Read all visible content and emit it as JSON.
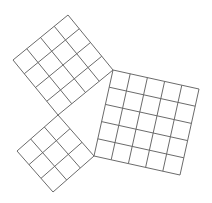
{
  "diagram": {
    "title": "",
    "stroke_color": "#6b6b6b",
    "background": "#ffffff",
    "squares": [
      {
        "name": "square-top",
        "grid": 4,
        "corners": [
          [
            58,
            115
          ],
          [
            113,
            70
          ],
          [
            68,
            15
          ],
          [
            13,
            60
          ]
        ]
      },
      {
        "name": "square-right",
        "grid": 5,
        "corners": [
          [
            113,
            70
          ],
          [
            94,
            156
          ],
          [
            180,
            175
          ],
          [
            199,
            89
          ]
        ]
      },
      {
        "name": "square-small",
        "grid": 3,
        "corners": [
          [
            94,
            156
          ],
          [
            58,
            115
          ],
          [
            17,
            151
          ],
          [
            53,
            192
          ]
        ]
      }
    ]
  }
}
